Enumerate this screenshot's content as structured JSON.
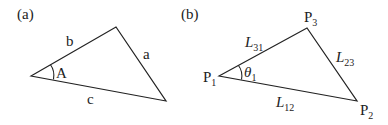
{
  "panel_a": {
    "label": "(a)",
    "sides": {
      "b": "b",
      "a": "a",
      "c": "c"
    },
    "angle": "A"
  },
  "panel_b": {
    "label": "(b)",
    "vertices": {
      "p1": "P",
      "p1_sub": "1",
      "p2": "P",
      "p2_sub": "2",
      "p3": "P",
      "p3_sub": "3"
    },
    "sides": {
      "l31": "L",
      "l31_sub": "31",
      "l23": "L",
      "l23_sub": "23",
      "l12": "L",
      "l12_sub": "12"
    },
    "angle": "θ",
    "angle_sub": "1"
  },
  "colors": {
    "stroke": "#222222",
    "background": "#ffffff"
  }
}
